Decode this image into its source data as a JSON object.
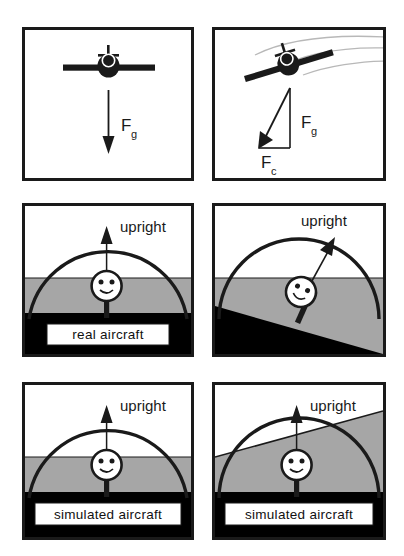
{
  "figure": {
    "width": 404,
    "height": 556,
    "background_color": "#ffffff",
    "ink_color": "#1a1a1a",
    "sky_color": "#ffffff",
    "horizon_band_color": "#a6a6a6",
    "ground_color": "#000000"
  },
  "panels": [
    {
      "id": "top-left",
      "row": 1,
      "column": 1,
      "scenario": "level flight",
      "aircraft_bank_deg": 0,
      "vectors": [
        {
          "name": "Fg",
          "symbol": "F",
          "subscript": "g",
          "direction": "down",
          "label": "F_g"
        }
      ],
      "has_trajectory_trails": false,
      "caption": ""
    },
    {
      "id": "top-right",
      "row": 1,
      "column": 2,
      "scenario": "banked turn",
      "aircraft_bank_deg": 25,
      "vectors": [
        {
          "name": "Fg",
          "symbol": "F",
          "subscript": "g",
          "direction": "down",
          "label": "F_g"
        },
        {
          "name": "Fc",
          "symbol": "F",
          "subscript": "c",
          "direction": "left",
          "label": "F_c"
        },
        {
          "name": "resultant",
          "symbol": "",
          "subscript": "",
          "direction": "down-left",
          "label": ""
        }
      ],
      "has_trajectory_trails": true,
      "caption": ""
    },
    {
      "id": "middle-left",
      "row": 2,
      "column": 1,
      "scenario": "real aircraft, level",
      "upright_label": "upright",
      "upright_arrow_angle_deg": 0,
      "horizon_tilt_deg": 0,
      "ground_tilt_deg": 0,
      "head_tilt_deg": 0,
      "caption": "real  aircraft",
      "caption_visible": true
    },
    {
      "id": "middle-right",
      "row": 2,
      "column": 2,
      "scenario": "real aircraft, banked",
      "upright_label": "upright",
      "upright_arrow_angle_deg": 28,
      "horizon_tilt_deg": 0,
      "ground_tilt_deg": 20,
      "head_tilt_deg": 26,
      "caption": "",
      "caption_visible": false
    },
    {
      "id": "bottom-left",
      "row": 3,
      "column": 1,
      "scenario": "simulated aircraft, level",
      "upright_label": "upright",
      "upright_arrow_angle_deg": 0,
      "horizon_tilt_deg": 0,
      "ground_tilt_deg": 0,
      "head_tilt_deg": 0,
      "caption": "simulated  aircraft",
      "caption_visible": true
    },
    {
      "id": "bottom-right",
      "row": 3,
      "column": 2,
      "scenario": "simulated aircraft, banked",
      "upright_label": "upright",
      "upright_arrow_angle_deg": 0,
      "horizon_tilt_deg": 18,
      "ground_tilt_deg": 0,
      "head_tilt_deg": 0,
      "caption": "simulated  aircraft",
      "caption_visible": true
    }
  ],
  "labels": {
    "upright": "upright",
    "real_aircraft": "real  aircraft",
    "simulated_aircraft": "simulated  aircraft",
    "fg_symbol": "F",
    "fg_subscript": "g",
    "fc_symbol": "F",
    "fc_subscript": "c"
  }
}
